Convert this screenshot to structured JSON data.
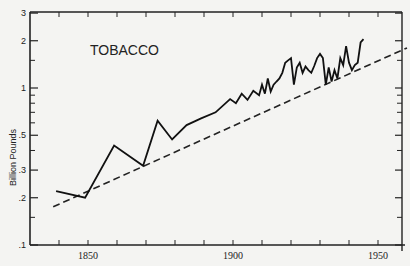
{
  "chart_data": {
    "type": "line",
    "title": "TOBACCO",
    "xlabel": "",
    "ylabel": "Billion Pounds",
    "yscale": "log",
    "ylim": [
      0.1,
      3
    ],
    "xlim": [
      1830,
      1960
    ],
    "x_tick_labels": [
      "1850",
      "1900",
      "1950"
    ],
    "y_tick_labels": [
      ".1",
      ".2",
      ".3",
      ".5",
      "1",
      "2",
      "3"
    ],
    "grid": false,
    "series": [
      {
        "name": "Tobacco production",
        "style": "solid",
        "x": [
          1839,
          1849,
          1859,
          1869,
          1874,
          1879,
          1884,
          1889,
          1894,
          1899,
          1901,
          1903,
          1905,
          1907,
          1909,
          1910,
          1911,
          1912,
          1913,
          1914,
          1915,
          1916,
          1917,
          1918,
          1919,
          1920,
          1921,
          1922,
          1923,
          1924,
          1925,
          1926,
          1927,
          1928,
          1929,
          1930,
          1931,
          1932,
          1933,
          1934,
          1935,
          1936,
          1937,
          1938,
          1939,
          1940,
          1941,
          1942,
          1943,
          1944,
          1945
        ],
        "values": [
          0.22,
          0.2,
          0.43,
          0.32,
          0.62,
          0.47,
          0.58,
          0.64,
          0.7,
          0.85,
          0.8,
          0.92,
          0.84,
          0.96,
          0.9,
          1.05,
          0.92,
          1.15,
          0.95,
          1.05,
          1.1,
          1.15,
          1.25,
          1.45,
          1.5,
          1.55,
          1.05,
          1.35,
          1.45,
          1.25,
          1.37,
          1.3,
          1.25,
          1.38,
          1.55,
          1.65,
          1.55,
          1.05,
          1.35,
          1.1,
          1.3,
          1.15,
          1.55,
          1.4,
          1.85,
          1.45,
          1.3,
          1.4,
          1.45,
          1.95,
          2.05
        ]
      },
      {
        "name": "Trend",
        "style": "dashed",
        "x": [
          1838,
          1960
        ],
        "values": [
          0.175,
          1.8
        ]
      }
    ]
  }
}
